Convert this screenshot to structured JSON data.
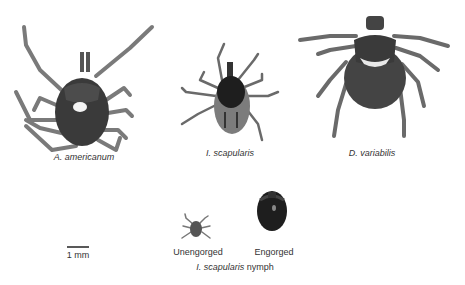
{
  "figure": {
    "specimens": [
      {
        "id": "a-americanum",
        "label": "A. americanum"
      },
      {
        "id": "i-scapularis",
        "label": "I. scapularis"
      },
      {
        "id": "d-variabilis",
        "label": "D. variabilis"
      }
    ],
    "nymphs": {
      "unengorged_label": "Unengorged",
      "engorged_label": "Engorged",
      "caption_italic": "I. scapularis",
      "caption_rest": " nymph"
    },
    "scale_bar": {
      "label": "1 mm"
    },
    "colors": {
      "body_dark": "#2a2a2a",
      "body_mid": "#4a4a4a",
      "leg": "#777777",
      "shield_light": "#f2f2f2"
    }
  }
}
